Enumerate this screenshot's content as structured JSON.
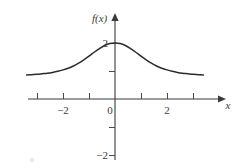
{
  "figure": {
    "background_color": "#ffffff",
    "curve_color": "#2b2b2b",
    "axis_color": "#3a3a3a",
    "text_color": "#3c3c3c"
  },
  "labels": {
    "y_axis_title": "f(x)",
    "x_axis_title": "x",
    "x_neg2": "−2",
    "x_zero": "0",
    "x_pos2": "2",
    "y_pos2": "2",
    "y_neg2": "−2"
  },
  "chart_data": {
    "type": "line",
    "title": "",
    "subtitle": "",
    "xlabel": "x",
    "ylabel": "f(x)",
    "xlim": [
      -3.55,
      3.55
    ],
    "ylim": [
      -2.6,
      2.9
    ],
    "grid": false,
    "legend": null,
    "x_ticks": [
      -3,
      -2,
      -1,
      0,
      1,
      2,
      3
    ],
    "x_tick_labels": [
      "",
      "−2",
      "",
      "0",
      "",
      "2",
      ""
    ],
    "y_ticks": [
      -2,
      -1,
      1,
      2
    ],
    "y_tick_labels": [
      "−2",
      "",
      "",
      "2"
    ],
    "annotations": [],
    "series": [
      {
        "name": "f(x)",
        "description": "Bell-shaped (Lorentzian-like) curve, peak value 2 at x = 0, decaying symmetrically to about 0.85 at the plotted edges",
        "peak_x": 0,
        "peak_y": 2,
        "asymptote_level": 0.85,
        "x": [
          -3.4,
          -3.2,
          -3.0,
          -2.8,
          -2.6,
          -2.4,
          -2.2,
          -2.0,
          -1.8,
          -1.6,
          -1.4,
          -1.2,
          -1.0,
          -0.8,
          -0.6,
          -0.4,
          -0.2,
          0.0,
          0.2,
          0.4,
          0.6,
          0.8,
          1.0,
          1.2,
          1.4,
          1.6,
          1.8,
          2.0,
          2.2,
          2.4,
          2.6,
          2.8,
          3.0,
          3.2,
          3.4
        ],
        "y": [
          0.86,
          0.87,
          0.88,
          0.9,
          0.92,
          0.95,
          0.99,
          1.04,
          1.1,
          1.18,
          1.28,
          1.4,
          1.53,
          1.67,
          1.8,
          1.91,
          1.98,
          2.0,
          1.98,
          1.91,
          1.8,
          1.67,
          1.53,
          1.4,
          1.28,
          1.18,
          1.1,
          1.04,
          0.99,
          0.95,
          0.92,
          0.9,
          0.88,
          0.87,
          0.86
        ]
      }
    ]
  }
}
